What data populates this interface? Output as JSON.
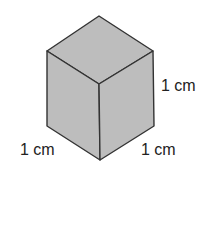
{
  "diagram": {
    "type": "unit-cube",
    "colors": {
      "face_fill": "#bdbdbd",
      "edge_stroke": "#333333",
      "label_text": "#222222"
    },
    "labels": {
      "height": "1 cm",
      "left_depth": "1 cm",
      "right_width": "1 cm"
    }
  }
}
